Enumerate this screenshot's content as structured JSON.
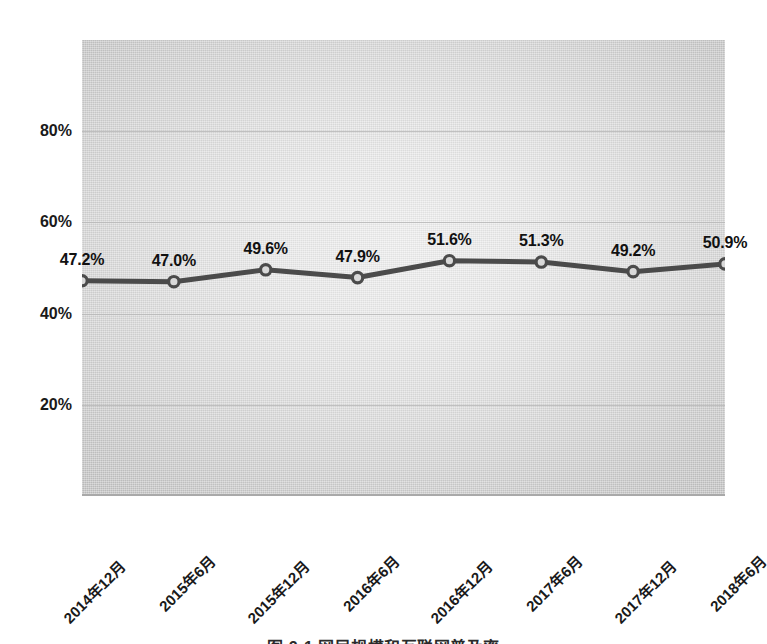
{
  "chart_data": {
    "type": "line",
    "title": "",
    "xlabel": "",
    "ylabel": "",
    "categories": [
      "2014年12月",
      "2015年6月",
      "2015年12月",
      "2016年6月",
      "2016年12月",
      "2017年6月",
      "2017年12月",
      "2018年6月"
    ],
    "values": [
      47.2,
      47.0,
      49.6,
      47.9,
      51.6,
      51.3,
      49.2,
      50.9
    ],
    "point_labels": [
      "47.2%",
      "47.0%",
      "49.6%",
      "47.9%",
      "51.6%",
      "51.3%",
      "49.2%",
      "50.9%"
    ],
    "ylim": [
      0,
      100
    ],
    "yticks": [
      20,
      40,
      60,
      80
    ],
    "ytick_labels": [
      "20%",
      "40%",
      "60%",
      "80%"
    ],
    "grid": true,
    "legend": "none",
    "series_name": "",
    "unit": "%"
  },
  "style": {
    "line_color": "#4b4b4b",
    "marker_fill": "#d9d9d9",
    "marker_stroke": "#4b4b4b",
    "gridline_color": "#b9b9b9",
    "plot_bg_light": "#eeeeee",
    "plot_bg_dark": "#c4c4c4",
    "text_color": "#1a1a1a",
    "page_bg": "#ffffff"
  },
  "caption": {
    "text": "图 2-1  网民规模和互联网普及率"
  }
}
